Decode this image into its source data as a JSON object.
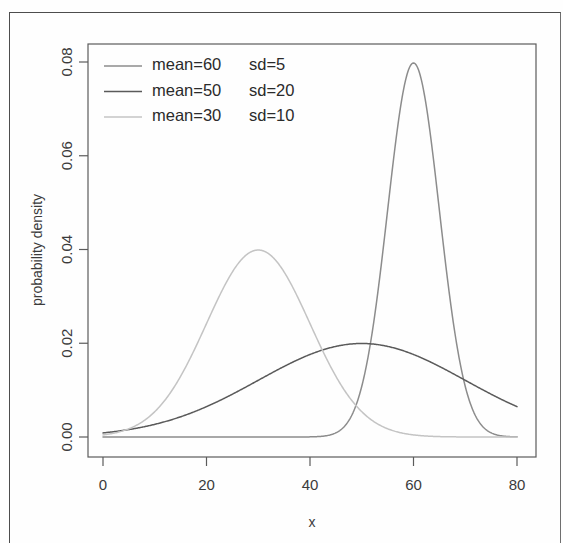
{
  "chart_data": {
    "type": "line",
    "title": "",
    "xlabel": "x",
    "ylabel": "probability density",
    "xlim": [
      0,
      80
    ],
    "ylim": [
      0,
      0.08
    ],
    "xticks": [
      0,
      20,
      40,
      60,
      80
    ],
    "yticks": [
      0.0,
      0.02,
      0.04,
      0.06,
      0.08
    ],
    "xtick_labels": [
      "0",
      "20",
      "40",
      "60",
      "80"
    ],
    "ytick_labels": [
      "0.00",
      "0.02",
      "0.04",
      "0.06",
      "0.08"
    ],
    "grid": false,
    "legend_position": "top-left",
    "series": [
      {
        "name": "mean=60   sd=5",
        "mean": 60,
        "sd": 5,
        "peak_value": 0.0798,
        "color": "#8c8c8c",
        "legend_mean": "mean=60",
        "legend_sd": "sd=5"
      },
      {
        "name": "mean=50   sd=20",
        "mean": 50,
        "sd": 20,
        "peak_value": 0.0199,
        "color": "#5a5a5a",
        "legend_mean": "mean=50",
        "legend_sd": "sd=20"
      },
      {
        "name": "mean=30   sd=10",
        "mean": 30,
        "sd": 10,
        "peak_value": 0.0399,
        "color": "#c4c4c4",
        "legend_mean": "mean=30",
        "legend_sd": "sd=10"
      }
    ]
  },
  "plot": {
    "frame_color": "#5b5b5b",
    "background": "#ffffff"
  }
}
